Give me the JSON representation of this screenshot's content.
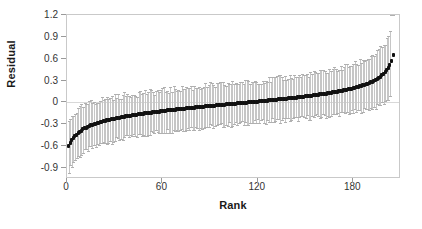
{
  "chart_data": {
    "type": "scatter",
    "title": "",
    "xlabel": "Rank",
    "ylabel": "Residual",
    "xlim": [
      0,
      210
    ],
    "ylim": [
      -1.05,
      1.2
    ],
    "grid": false,
    "zero_reference_line": 0,
    "legend": null,
    "xticks": [
      0,
      60,
      120,
      180
    ],
    "xtick_labels": [
      "0",
      "60",
      "120",
      "180"
    ],
    "yticks": [
      1.2,
      0.9,
      0.6,
      0.3,
      0,
      -0.3,
      -0.6,
      -0.9
    ],
    "ytick_labels": [
      "1.2",
      "0.9",
      "0.6",
      "0.3",
      "0",
      "-0.3",
      "-0.6",
      "-0.9"
    ],
    "series": [
      {
        "name": "Residual",
        "marker": "filled-square",
        "marker_color": "#111111",
        "errorbar_color": "#c6c6c6",
        "n_points": 205,
        "x": [
          1,
          2,
          3,
          4,
          5,
          6,
          7,
          8,
          9,
          10,
          11,
          12,
          13,
          14,
          15,
          16,
          17,
          18,
          19,
          20,
          21,
          22,
          23,
          24,
          25,
          26,
          27,
          28,
          29,
          30,
          31,
          32,
          33,
          34,
          35,
          36,
          37,
          38,
          39,
          40,
          41,
          42,
          43,
          44,
          45,
          46,
          47,
          48,
          49,
          50,
          51,
          52,
          53,
          54,
          55,
          56,
          57,
          58,
          59,
          60,
          61,
          62,
          63,
          64,
          65,
          66,
          67,
          68,
          69,
          70,
          71,
          72,
          73,
          74,
          75,
          76,
          77,
          78,
          79,
          80,
          81,
          82,
          83,
          84,
          85,
          86,
          87,
          88,
          89,
          90,
          91,
          92,
          93,
          94,
          95,
          96,
          97,
          98,
          99,
          100,
          101,
          102,
          103,
          104,
          105,
          106,
          107,
          108,
          109,
          110,
          111,
          112,
          113,
          114,
          115,
          116,
          117,
          118,
          119,
          120,
          121,
          122,
          123,
          124,
          125,
          126,
          127,
          128,
          129,
          130,
          131,
          132,
          133,
          134,
          135,
          136,
          137,
          138,
          139,
          140,
          141,
          142,
          143,
          144,
          145,
          146,
          147,
          148,
          149,
          150,
          151,
          152,
          153,
          154,
          155,
          156,
          157,
          158,
          159,
          160,
          161,
          162,
          163,
          164,
          165,
          166,
          167,
          168,
          169,
          170,
          171,
          172,
          173,
          174,
          175,
          176,
          177,
          178,
          179,
          180,
          181,
          182,
          183,
          184,
          185,
          186,
          187,
          188,
          189,
          190,
          191,
          192,
          193,
          194,
          195,
          196,
          197,
          198,
          199,
          200,
          201,
          202,
          203,
          204,
          205
        ],
        "y": [
          -0.6,
          -0.56,
          -0.52,
          -0.49,
          -0.46,
          -0.44,
          -0.42,
          -0.4,
          -0.385,
          -0.37,
          -0.357,
          -0.345,
          -0.334,
          -0.324,
          -0.315,
          -0.306,
          -0.298,
          -0.29,
          -0.283,
          -0.276,
          -0.269,
          -0.263,
          -0.257,
          -0.251,
          -0.246,
          -0.24,
          -0.235,
          -0.23,
          -0.225,
          -0.221,
          -0.216,
          -0.212,
          -0.207,
          -0.203,
          -0.199,
          -0.195,
          -0.191,
          -0.187,
          -0.184,
          -0.18,
          -0.176,
          -0.173,
          -0.169,
          -0.166,
          -0.163,
          -0.159,
          -0.156,
          -0.153,
          -0.15,
          -0.147,
          -0.144,
          -0.141,
          -0.138,
          -0.135,
          -0.132,
          -0.129,
          -0.126,
          -0.124,
          -0.121,
          -0.118,
          -0.116,
          -0.113,
          -0.11,
          -0.108,
          -0.105,
          -0.103,
          -0.1,
          -0.098,
          -0.095,
          -0.093,
          -0.09,
          -0.088,
          -0.086,
          -0.083,
          -0.081,
          -0.079,
          -0.076,
          -0.074,
          -0.072,
          -0.07,
          -0.067,
          -0.065,
          -0.063,
          -0.061,
          -0.059,
          -0.056,
          -0.054,
          -0.052,
          -0.05,
          -0.048,
          -0.046,
          -0.044,
          -0.042,
          -0.039,
          -0.037,
          -0.035,
          -0.033,
          -0.031,
          -0.029,
          -0.027,
          -0.025,
          -0.023,
          -0.021,
          -0.019,
          -0.017,
          -0.015,
          -0.013,
          -0.011,
          -0.009,
          -0.007,
          -0.005,
          -0.003,
          -0.001,
          0.001,
          0.003,
          0.005,
          0.007,
          0.009,
          0.011,
          0.013,
          0.015,
          0.017,
          0.019,
          0.022,
          0.024,
          0.026,
          0.028,
          0.03,
          0.032,
          0.035,
          0.037,
          0.039,
          0.041,
          0.044,
          0.046,
          0.048,
          0.051,
          0.053,
          0.055,
          0.058,
          0.06,
          0.063,
          0.065,
          0.068,
          0.07,
          0.073,
          0.076,
          0.078,
          0.081,
          0.084,
          0.086,
          0.089,
          0.092,
          0.095,
          0.098,
          0.101,
          0.104,
          0.107,
          0.11,
          0.113,
          0.117,
          0.12,
          0.123,
          0.127,
          0.13,
          0.134,
          0.138,
          0.141,
          0.145,
          0.149,
          0.153,
          0.157,
          0.162,
          0.166,
          0.171,
          0.175,
          0.18,
          0.185,
          0.19,
          0.196,
          0.201,
          0.207,
          0.213,
          0.22,
          0.226,
          0.233,
          0.241,
          0.249,
          0.257,
          0.266,
          0.276,
          0.286,
          0.297,
          0.309,
          0.322,
          0.337,
          0.353,
          0.371,
          0.392,
          0.416,
          0.444,
          0.478,
          0.52,
          0.575,
          0.65
        ],
        "yerr_low": [
          0.33,
          0.33,
          0.33,
          0.33,
          0.32,
          0.32,
          0.32,
          0.32,
          0.32,
          0.32,
          0.31,
          0.31,
          0.31,
          0.31,
          0.31,
          0.31,
          0.31,
          0.31,
          0.3,
          0.3,
          0.3,
          0.3,
          0.3,
          0.3,
          0.3,
          0.3,
          0.3,
          0.3,
          0.3,
          0.3,
          0.29,
          0.29,
          0.29,
          0.29,
          0.29,
          0.29,
          0.29,
          0.29,
          0.29,
          0.29,
          0.29,
          0.29,
          0.29,
          0.29,
          0.29,
          0.29,
          0.29,
          0.29,
          0.29,
          0.29,
          0.29,
          0.28,
          0.28,
          0.28,
          0.28,
          0.28,
          0.28,
          0.28,
          0.28,
          0.28,
          0.28,
          0.28,
          0.28,
          0.28,
          0.28,
          0.28,
          0.28,
          0.28,
          0.28,
          0.28,
          0.28,
          0.28,
          0.28,
          0.28,
          0.28,
          0.28,
          0.28,
          0.28,
          0.28,
          0.28,
          0.28,
          0.28,
          0.28,
          0.28,
          0.28,
          0.28,
          0.28,
          0.28,
          0.28,
          0.28,
          0.28,
          0.28,
          0.28,
          0.28,
          0.28,
          0.28,
          0.28,
          0.28,
          0.28,
          0.28,
          0.28,
          0.28,
          0.28,
          0.28,
          0.28,
          0.28,
          0.28,
          0.28,
          0.28,
          0.28,
          0.28,
          0.28,
          0.28,
          0.28,
          0.28,
          0.28,
          0.28,
          0.28,
          0.28,
          0.28,
          0.28,
          0.28,
          0.28,
          0.28,
          0.28,
          0.28,
          0.28,
          0.28,
          0.28,
          0.28,
          0.29,
          0.29,
          0.29,
          0.29,
          0.29,
          0.29,
          0.29,
          0.29,
          0.29,
          0.29,
          0.29,
          0.29,
          0.29,
          0.29,
          0.29,
          0.29,
          0.29,
          0.29,
          0.29,
          0.29,
          0.29,
          0.3,
          0.3,
          0.3,
          0.3,
          0.3,
          0.3,
          0.3,
          0.3,
          0.3,
          0.3,
          0.3,
          0.3,
          0.31,
          0.31,
          0.31,
          0.31,
          0.31,
          0.31,
          0.31,
          0.31,
          0.31,
          0.32,
          0.32,
          0.32,
          0.32,
          0.32,
          0.32,
          0.33,
          0.33,
          0.33,
          0.33,
          0.33,
          0.34,
          0.34,
          0.34,
          0.34,
          0.35,
          0.35,
          0.35,
          0.36,
          0.36,
          0.36,
          0.37,
          0.37,
          0.38,
          0.38,
          0.39,
          0.39,
          0.4,
          0.41,
          0.42,
          0.43
        ],
        "yerr_high": [
          0.33,
          0.33,
          0.33,
          0.33,
          0.32,
          0.32,
          0.32,
          0.32,
          0.32,
          0.32,
          0.31,
          0.31,
          0.31,
          0.31,
          0.31,
          0.31,
          0.31,
          0.31,
          0.3,
          0.3,
          0.3,
          0.3,
          0.3,
          0.3,
          0.3,
          0.3,
          0.3,
          0.3,
          0.3,
          0.3,
          0.29,
          0.29,
          0.29,
          0.29,
          0.29,
          0.29,
          0.29,
          0.29,
          0.29,
          0.29,
          0.29,
          0.29,
          0.29,
          0.29,
          0.29,
          0.29,
          0.29,
          0.29,
          0.29,
          0.29,
          0.29,
          0.28,
          0.28,
          0.28,
          0.28,
          0.28,
          0.28,
          0.28,
          0.28,
          0.28,
          0.28,
          0.28,
          0.28,
          0.28,
          0.28,
          0.28,
          0.28,
          0.28,
          0.28,
          0.28,
          0.28,
          0.28,
          0.28,
          0.28,
          0.28,
          0.28,
          0.28,
          0.28,
          0.28,
          0.28,
          0.28,
          0.28,
          0.28,
          0.28,
          0.28,
          0.28,
          0.28,
          0.28,
          0.28,
          0.28,
          0.28,
          0.28,
          0.28,
          0.28,
          0.28,
          0.28,
          0.28,
          0.28,
          0.28,
          0.28,
          0.28,
          0.28,
          0.28,
          0.28,
          0.28,
          0.28,
          0.28,
          0.28,
          0.28,
          0.28,
          0.28,
          0.28,
          0.28,
          0.28,
          0.28,
          0.28,
          0.28,
          0.28,
          0.28,
          0.28,
          0.28,
          0.28,
          0.28,
          0.28,
          0.28,
          0.28,
          0.28,
          0.28,
          0.28,
          0.28,
          0.29,
          0.29,
          0.29,
          0.29,
          0.29,
          0.29,
          0.29,
          0.29,
          0.29,
          0.29,
          0.29,
          0.29,
          0.29,
          0.29,
          0.29,
          0.29,
          0.29,
          0.29,
          0.29,
          0.29,
          0.29,
          0.3,
          0.3,
          0.3,
          0.3,
          0.3,
          0.3,
          0.3,
          0.3,
          0.3,
          0.3,
          0.3,
          0.3,
          0.31,
          0.31,
          0.31,
          0.31,
          0.31,
          0.31,
          0.31,
          0.31,
          0.31,
          0.32,
          0.32,
          0.32,
          0.32,
          0.32,
          0.32,
          0.33,
          0.33,
          0.33,
          0.33,
          0.33,
          0.34,
          0.34,
          0.34,
          0.34,
          0.35,
          0.35,
          0.35,
          0.36,
          0.36,
          0.36,
          0.37,
          0.37,
          0.38,
          0.38,
          0.39,
          0.39,
          0.4,
          0.41,
          0.42,
          0.43
        ]
      }
    ]
  }
}
